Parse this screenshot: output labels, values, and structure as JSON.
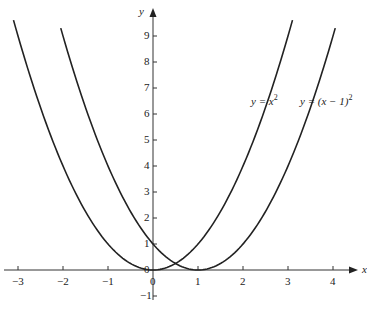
{
  "chart_data": {
    "type": "line",
    "title": "",
    "xlabel": "x",
    "ylabel": "y",
    "xlim": [
      -3.3,
      4.5
    ],
    "ylim": [
      -1.3,
      10
    ],
    "grid": false,
    "x_ticks": [
      -3,
      -2,
      -1,
      0,
      1,
      2,
      3,
      4
    ],
    "y_ticks": [
      -1,
      0,
      1,
      2,
      3,
      4,
      5,
      6,
      7,
      8,
      9
    ],
    "series": [
      {
        "name": "y = x^2",
        "label": "y = x",
        "exponent": "2",
        "function": "x^2",
        "x": [
          -3,
          -2,
          -1,
          0,
          1,
          2,
          3
        ],
        "values": [
          9,
          4,
          1,
          0,
          1,
          4,
          9
        ]
      },
      {
        "name": "y = (x-1)^2",
        "label": "y = (x − 1)",
        "exponent": "2",
        "function": "(x-1)^2",
        "x": [
          -2,
          -1,
          0,
          1,
          2,
          3,
          4
        ],
        "values": [
          9,
          4,
          1,
          0,
          1,
          4,
          9
        ]
      }
    ]
  },
  "labels": {
    "x_axis": "x",
    "y_axis": "y",
    "x_ticks": [
      "−3",
      "−2",
      "−1",
      "0",
      "1",
      "2",
      "3",
      "4"
    ],
    "y_ticks": [
      "−1",
      "0",
      "1",
      "2",
      "3",
      "4",
      "5",
      "6",
      "7",
      "8",
      "9"
    ],
    "curve1": "y = x",
    "curve1_exp": "2",
    "curve2": "y = (x − 1)",
    "curve2_exp": "2"
  }
}
